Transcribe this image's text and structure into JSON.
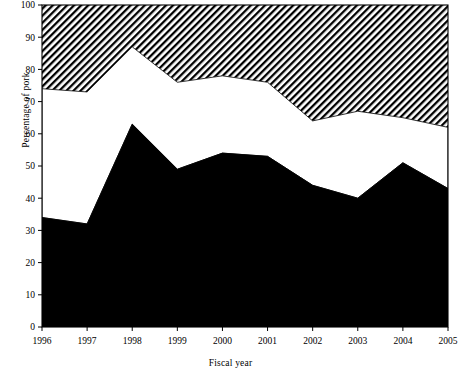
{
  "chart_data": {
    "type": "area",
    "title": "",
    "xlabel": "Fiscal year",
    "ylabel": "Percentage of pork",
    "categories": [
      "1996",
      "1997",
      "1998",
      "1999",
      "2000",
      "2001",
      "2002",
      "2003",
      "2004",
      "2005"
    ],
    "x": [
      1996,
      1997,
      1998,
      1999,
      2000,
      2001,
      2002,
      2003,
      2004,
      2005
    ],
    "xlim": [
      1996,
      2005
    ],
    "ylim": [
      0,
      100
    ],
    "yticks": [
      0,
      10,
      20,
      30,
      40,
      50,
      60,
      70,
      80,
      90,
      100
    ],
    "ytick_labels": [
      "0",
      "10",
      "20",
      "30",
      "40",
      "50",
      "60",
      "70",
      "80",
      "90",
      "100"
    ],
    "xticks": [
      1996,
      1997,
      1998,
      1999,
      2000,
      2001,
      2002,
      2003,
      2004,
      2005
    ],
    "xtick_labels": [
      "1996",
      "1997",
      "1998",
      "1999",
      "2000",
      "2001",
      "2002",
      "2003",
      "2004",
      "2005"
    ],
    "grid": false,
    "legend": null,
    "stacked": true,
    "series": [
      {
        "name": "black-band",
        "fill": "solid-black",
        "color": "#000000",
        "values": [
          34,
          32,
          63,
          49,
          54,
          53,
          44,
          40,
          51,
          43
        ]
      },
      {
        "name": "white-band",
        "fill": "solid-white",
        "color": "#ffffff",
        "values": [
          40,
          41,
          24,
          27,
          24,
          23,
          20,
          27,
          14,
          19
        ]
      },
      {
        "name": "hatched-band",
        "fill": "diagonal-hatch",
        "color": "#000000",
        "values": [
          26,
          27,
          13,
          24,
          22,
          24,
          36,
          33,
          35,
          38
        ]
      }
    ],
    "cumulative_boundaries": {
      "black_top": [
        34,
        32,
        63,
        49,
        54,
        53,
        44,
        40,
        51,
        43
      ],
      "white_top": [
        74,
        73,
        87,
        76,
        78,
        76,
        64,
        67,
        65,
        62
      ],
      "hatch_top": [
        100,
        100,
        100,
        100,
        100,
        100,
        100,
        100,
        100,
        100
      ]
    }
  },
  "axes": {
    "y_axis_label": "Percentage of pork",
    "x_axis_label": "Fiscal year"
  }
}
